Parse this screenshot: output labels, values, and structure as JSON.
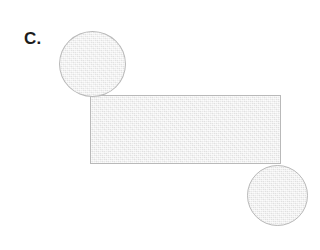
{
  "figure": {
    "label": "C.",
    "background_color": "#ffffff",
    "shape_fill_color": "#ebebeb",
    "shape_stroke_color": "#b9b9b9",
    "label_color": "#1c1c1c",
    "shapes": [
      {
        "name": "circle-top-left",
        "type": "circle",
        "x": 59,
        "y": 31,
        "width": 67,
        "height": 66
      },
      {
        "name": "rectangle-main",
        "type": "rectangle",
        "x": 90,
        "y": 95,
        "width": 191,
        "height": 69
      },
      {
        "name": "circle-bottom-right",
        "type": "circle",
        "x": 247,
        "y": 165,
        "width": 61,
        "height": 61
      }
    ]
  }
}
